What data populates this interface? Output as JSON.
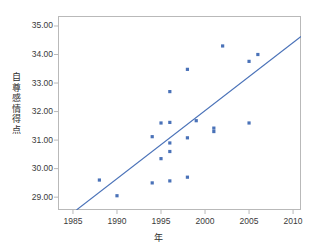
{
  "chart_data": {
    "type": "scatter",
    "title": "",
    "xlabel": "年",
    "ylabel": "自尊感情得点",
    "xlim": [
      1983.3,
      1010.0
    ],
    "x_axis_range": [
      1983.3,
      2010.9
    ],
    "ylim": [
      28.55,
      35.35
    ],
    "grid": false,
    "legend": null,
    "x_ticks": [
      1985,
      1990,
      1995,
      2000,
      2005,
      2010
    ],
    "x_tick_labels": [
      "1985",
      "1990",
      "1995",
      "2000",
      "2005",
      "2010"
    ],
    "y_ticks": [
      29.0,
      30.0,
      31.0,
      32.0,
      33.0,
      34.0,
      35.0
    ],
    "y_tick_labels": [
      "29.00",
      "30.00",
      "31.00",
      "32.00",
      "33.00",
      "34.00",
      "35.00"
    ],
    "point_color": "#4a72b8",
    "line_color": "#4a72b8",
    "frame_color": "#b9b9b9",
    "points": [
      {
        "x": 1988.0,
        "y": 29.6
      },
      {
        "x": 1990.0,
        "y": 29.05
      },
      {
        "x": 1994.0,
        "y": 29.5
      },
      {
        "x": 1994.0,
        "y": 31.12
      },
      {
        "x": 1995.0,
        "y": 30.35
      },
      {
        "x": 1995.0,
        "y": 31.6
      },
      {
        "x": 1996.0,
        "y": 29.57
      },
      {
        "x": 1996.0,
        "y": 30.6
      },
      {
        "x": 1996.0,
        "y": 30.9
      },
      {
        "x": 1996.0,
        "y": 31.62
      },
      {
        "x": 1996.0,
        "y": 32.7
      },
      {
        "x": 1998.0,
        "y": 29.7
      },
      {
        "x": 1998.0,
        "y": 31.08
      },
      {
        "x": 1998.0,
        "y": 33.48
      },
      {
        "x": 1999.0,
        "y": 31.68
      },
      {
        "x": 2001.0,
        "y": 31.3
      },
      {
        "x": 2001.0,
        "y": 31.42
      },
      {
        "x": 2002.0,
        "y": 34.3
      },
      {
        "x": 2005.0,
        "y": 31.6
      },
      {
        "x": 2005.0,
        "y": 33.76
      },
      {
        "x": 2006.0,
        "y": 34.0
      }
    ],
    "trendline": {
      "label": "regression-line",
      "x1": 1985.4,
      "y1": 28.55,
      "x2": 2010.9,
      "y2": 34.63
    }
  }
}
